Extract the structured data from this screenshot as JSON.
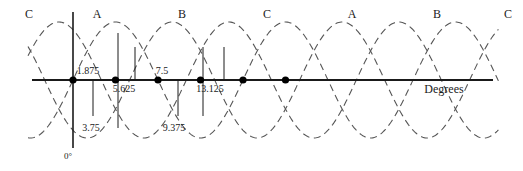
{
  "figure": {
    "title": "",
    "axis_label_x": "Degrees",
    "origin_label": "0°",
    "phase_labels": [
      {
        "text": "C",
        "x": 29,
        "y": 18
      },
      {
        "text": "A",
        "x": 97,
        "y": 18
      },
      {
        "text": "B",
        "x": 182,
        "y": 18
      },
      {
        "text": "C",
        "x": 267,
        "y": 18
      },
      {
        "text": "A",
        "x": 352,
        "y": 18
      },
      {
        "text": "B",
        "x": 437,
        "y": 18
      },
      {
        "text": "C",
        "x": 508,
        "y": 18
      }
    ],
    "value_labels": [
      {
        "text": "1.875",
        "x": 88,
        "y": 74
      },
      {
        "text": "5.625",
        "x": 124,
        "y": 92
      },
      {
        "text": "7.5",
        "x": 162,
        "y": 74
      },
      {
        "text": "13.125",
        "x": 210,
        "y": 92
      },
      {
        "text": "3.75",
        "x": 91,
        "y": 131
      },
      {
        "text": "9.375",
        "x": 174,
        "y": 131
      }
    ],
    "axis_x_label_pos": {
      "x": 444,
      "y": 93
    },
    "origin_label_pos": {
      "x": 68,
      "y": 159
    },
    "colors": {
      "curve": "#555555",
      "axis": "#1a1a1a",
      "marker": "#000000",
      "text": "#1a1a1a",
      "background": "#ffffff"
    }
  },
  "chart_data": {
    "type": "line",
    "title": "",
    "xlabel": "Degrees",
    "ylabel": "",
    "x": [
      0,
      1.875,
      3.75,
      5.625,
      7.5,
      9.375,
      11.25,
      13.125,
      15
    ],
    "xlim": [
      -4.5,
      33
    ],
    "ylim": [
      -1.15,
      1.15
    ],
    "grid": false,
    "legend": [
      "A",
      "B",
      "C"
    ],
    "legend_position": "inline-above-peaks",
    "annotations": [
      {
        "label": "1.875",
        "value": 1.875
      },
      {
        "label": "3.75",
        "value": 3.75
      },
      {
        "label": "5.625",
        "value": 5.625
      },
      {
        "label": "7.5",
        "value": 7.5
      },
      {
        "label": "9.375",
        "value": 9.375
      },
      {
        "label": "13.125",
        "value": 13.125
      },
      {
        "label": "0°",
        "value": 0
      }
    ],
    "series": [
      {
        "name": "A",
        "phase_deg": 0,
        "amplitude": 1,
        "period": 15,
        "style": "dashed"
      },
      {
        "name": "B",
        "phase_deg": -120,
        "amplitude": 1,
        "period": 15,
        "style": "dashed"
      },
      {
        "name": "C",
        "phase_deg": 120,
        "amplitude": 1,
        "period": 15,
        "style": "dashed"
      }
    ],
    "zero_crossing_markers": [
      0,
      3.75,
      7.5,
      11.25,
      15,
      18.75
    ]
  }
}
